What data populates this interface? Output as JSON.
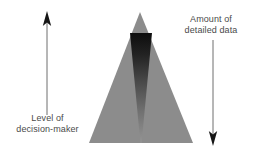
{
  "figure": {
    "type": "pyramid-diagram",
    "background_color": "#ffffff",
    "pyramid": {
      "name": "information-pyramid",
      "fill_color": "#8c8c8c",
      "apex": [
        140,
        12
      ],
      "base_left": [
        89,
        143
      ],
      "base_right": [
        193,
        143
      ]
    },
    "inner_wedge": {
      "name": "detailed-data-wedge",
      "description": "dark inverted wedge widest at top narrowing to a point at the bottom",
      "gradient_top_color": "#111111",
      "gradient_bottom_color": "#8f8f8f",
      "top_left": [
        130,
        33
      ],
      "top_right": [
        152,
        33
      ],
      "bottom_point": [
        141,
        143
      ]
    }
  },
  "left_axis": {
    "name": "level-of-decision-maker-axis",
    "arrow_direction": "up",
    "line_color": "#6e6e6e",
    "x": 47,
    "top_y": 12,
    "bottom_y": 115,
    "label_line_1": "Level of",
    "label_line_2": "decision-maker"
  },
  "right_axis": {
    "name": "amount-of-detailed-data-axis",
    "arrow_direction": "down",
    "line_color": "#6e6e6e",
    "x": 213,
    "top_y": 40,
    "bottom_y": 145,
    "label_line_1": "Amount of",
    "label_line_2": "detailed data"
  },
  "colors": {
    "text": "#4a4a4a",
    "pyramid_gray": "#8c8c8c",
    "wedge_dark": "#111111",
    "arrow": "#6e6e6e"
  }
}
